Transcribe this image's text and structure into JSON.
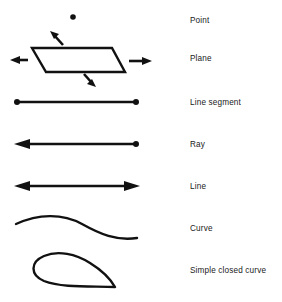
{
  "diagram": {
    "stroke_color": "#111111",
    "background_color": "#ffffff",
    "rows": [
      {
        "id": "point",
        "label": "Point",
        "figure": "single dot"
      },
      {
        "id": "plane",
        "label": "Plane",
        "figure": "parallelogram with four outward arrows"
      },
      {
        "id": "line-segment",
        "label": "Line segment",
        "figure": "horizontal line with dot endpoints on both ends"
      },
      {
        "id": "ray",
        "label": "Ray",
        "figure": "horizontal line with arrowhead on left and dot endpoint on right"
      },
      {
        "id": "line",
        "label": "Line",
        "figure": "horizontal line with arrowheads on both ends"
      },
      {
        "id": "curve",
        "label": "Curve",
        "figure": "open S-shaped curve"
      },
      {
        "id": "simple-closed-curve",
        "label": "Simple closed curve",
        "figure": "closed teardrop shaped loop"
      }
    ]
  }
}
